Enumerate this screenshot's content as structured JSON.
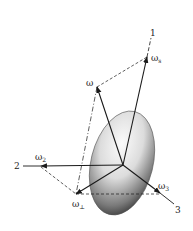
{
  "diagram": {
    "axes": [
      {
        "id": "1",
        "label": "1"
      },
      {
        "id": "2",
        "label": "2"
      },
      {
        "id": "3",
        "label": "3"
      }
    ],
    "vectors": {
      "omega": {
        "label": "ω"
      },
      "omega_s": {
        "label": "ω",
        "sub": "s"
      },
      "omega_2": {
        "label": "ω",
        "sub": "2"
      },
      "omega_perp": {
        "label": "ω",
        "sub": "⊥"
      },
      "omega_3": {
        "label": "ω",
        "sub": "3"
      }
    },
    "colors": {
      "line": "#1a1a1a",
      "body_light": "#f2f2f2",
      "body_dark": "#3a3a3a"
    }
  }
}
